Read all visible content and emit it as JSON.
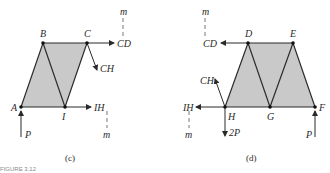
{
  "figure": {
    "fill_color": "#c9c9c9",
    "stroke_color": "#2a2a2a",
    "panel_c": {
      "caption": "(c)",
      "nodes": [
        "A",
        "B",
        "C",
        "I"
      ],
      "forces": {
        "cd": "CD",
        "ch": "CH",
        "ih": "IH",
        "p": "P"
      },
      "section_label_top": "m",
      "section_label_bottom": "m"
    },
    "panel_d": {
      "caption": "(d)",
      "nodes": [
        "D",
        "E",
        "F",
        "G",
        "H"
      ],
      "forces": {
        "cd": "CD",
        "ch": "CH",
        "ih": "IH",
        "two_p": "2P",
        "p": "P"
      },
      "section_label_top": "m",
      "section_label_bottom": "m"
    },
    "footer_fragment": "FIGURE 3.12"
  }
}
